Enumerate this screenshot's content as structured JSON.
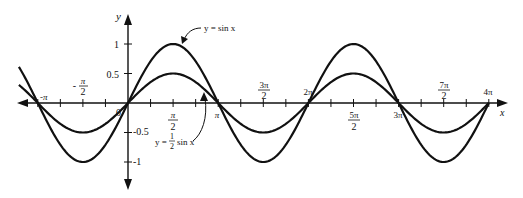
{
  "chart_data": {
    "type": "line",
    "title": "",
    "xlabel": "x",
    "ylabel": "y",
    "xlim": [
      -3.8,
      12.57
    ],
    "ylim": [
      -1.35,
      1.5
    ],
    "grid": false,
    "x_tick_labels": [
      "-π",
      "-π/2",
      "0",
      "π/2",
      "π",
      "3π/2",
      "2π",
      "5π/2",
      "3π",
      "7π/2",
      "4π"
    ],
    "y_tick_labels": [
      "1",
      "0.5",
      "-0.5",
      "-1"
    ],
    "series": [
      {
        "name": "y = sin x",
        "amplitude": 1,
        "function": "sin(x)",
        "x_range": [
          -3.8,
          12.566
        ]
      },
      {
        "name": "y = 1/2 sin x",
        "amplitude": 0.5,
        "function": "0.5*sin(x)",
        "x_range": [
          -3.8,
          12.566
        ]
      }
    ],
    "annotations": [
      {
        "text": "y = sin x",
        "points_to": "peak of sin x near x = π/2"
      },
      {
        "text": "y = 1/2 sin x",
        "points_to": "half-amplitude curve near x = 3π/4"
      }
    ],
    "legend": "none (inline annotations)"
  },
  "labels": {
    "x_axis": "x",
    "y_axis": "y",
    "origin": "0",
    "y1": "1",
    "y05": "0.5",
    "ym05": "-0.5",
    "ym1": "-1",
    "neg_pi": "-π",
    "neg_pi_half_num": "π",
    "neg_pi_half_den": "2",
    "neg_sign": "-",
    "pi_half_num": "π",
    "pi_half_den": "2",
    "pi": "π",
    "three_pi_half_num": "3π",
    "three_pi_half_den": "2",
    "two_pi": "2π",
    "five_pi_half_num": "5π",
    "five_pi_half_den": "2",
    "three_pi": "3π",
    "seven_pi_half_num": "7π",
    "seven_pi_half_den": "2",
    "four_pi": "4π",
    "sin_label": "y = sin x",
    "half_sin_prefix": "y =",
    "half_num": "1",
    "half_den": "2",
    "half_sin_suffix": "sin x"
  }
}
